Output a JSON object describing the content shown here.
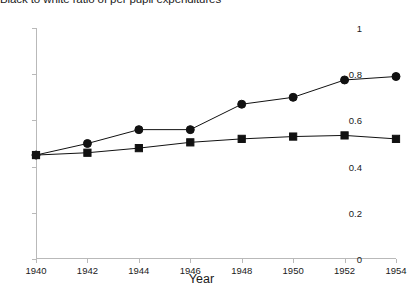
{
  "chart_data": {
    "type": "line",
    "title": "Black to white ratio of per pupil expenditures",
    "xlabel": "Year",
    "ylabel": "",
    "x": [
      1940,
      1942,
      1944,
      1946,
      1948,
      1950,
      1952,
      1954
    ],
    "xlim": [
      1940,
      1954
    ],
    "ylim": [
      0,
      1
    ],
    "xticks": [
      1940,
      1942,
      1944,
      1946,
      1948,
      1950,
      1952,
      1954
    ],
    "xtick_labels": [
      "1940",
      "1942",
      "1944",
      "1946",
      "1948",
      "1950",
      "1952",
      "1954"
    ],
    "yticks": [
      0,
      0.2,
      0.4,
      0.6,
      0.8,
      1
    ],
    "ytick_labels": [
      "0",
      "0.2",
      "0.4",
      "0.6",
      "0.8",
      "1"
    ],
    "grid": false,
    "legend": "none",
    "series": [
      {
        "name": "circle-series",
        "marker": "circle",
        "color": "#111111",
        "values": [
          0.45,
          0.5,
          0.56,
          0.56,
          0.67,
          0.7,
          0.775,
          0.79
        ]
      },
      {
        "name": "square-series",
        "marker": "square",
        "color": "#111111",
        "values": [
          0.45,
          0.46,
          0.48,
          0.505,
          0.52,
          0.53,
          0.535,
          0.52
        ]
      }
    ]
  },
  "axis": {
    "x_title": "Year"
  }
}
